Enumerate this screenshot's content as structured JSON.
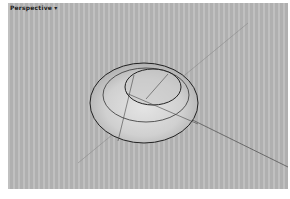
{
  "viewport": {
    "title": "Perspective",
    "menu_arrow": "▾",
    "background_color": "#b9b9b9",
    "object": "revolved dish surface"
  }
}
